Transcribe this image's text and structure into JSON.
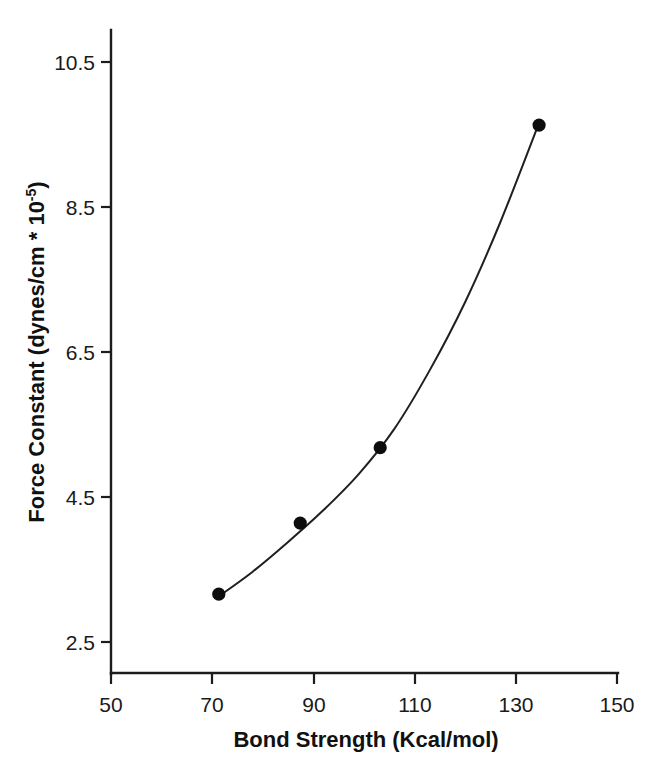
{
  "chart_data": {
    "type": "scatter",
    "title": "",
    "subtitle": "",
    "xlabel": "Bond Strength (Kcal/mol)",
    "ylabel_main": "Force Constant (dynes/cm * 10",
    "ylabel_exponent": "-5",
    "ylabel_tail": ")",
    "ylabel_full": "Force Constant (dynes/cm * 10^-5)",
    "xlim": [
      50,
      150
    ],
    "ylim": [
      2.5,
      10.5
    ],
    "xticks": [
      50,
      70,
      90,
      110,
      130,
      150
    ],
    "xtick_labels": [
      "50",
      "70",
      "90",
      "110",
      "130",
      "150"
    ],
    "yticks": [
      2.5,
      4.5,
      6.5,
      8.5,
      10.5
    ],
    "ytick_labels": [
      "2.5",
      "4.5",
      "6.5",
      "8.5",
      "10.5"
    ],
    "grid": false,
    "legend": "none",
    "marker_color": "#0d0d0d",
    "line_color": "#1f1f1f",
    "axis_color": "#1c1c1c",
    "background": "#ffffff",
    "x": [
      71.3,
      87.4,
      103.2,
      134.6
    ],
    "y": [
      3.16,
      4.14,
      5.18,
      9.63
    ],
    "points": [
      {
        "x": 71.3,
        "y": 3.16
      },
      {
        "x": 87.4,
        "y": 4.14
      },
      {
        "x": 103.2,
        "y": 5.18
      },
      {
        "x": 134.6,
        "y": 9.63
      }
    ],
    "series": [
      {
        "name": "Force constant vs bond strength",
        "x": [
          71.3,
          87.4,
          103.2,
          134.6
        ],
        "values": [
          3.16,
          4.14,
          5.18,
          9.63
        ]
      },
      {
        "name": "fitted curve",
        "x": [
          71.3,
          78.0,
          85.0,
          92.0,
          99.0,
          106.0,
          113.0,
          120.0,
          127.0,
          134.6
        ],
        "values": [
          3.13,
          3.47,
          3.88,
          4.32,
          4.82,
          5.44,
          6.25,
          7.19,
          8.3,
          9.66
        ]
      }
    ]
  }
}
